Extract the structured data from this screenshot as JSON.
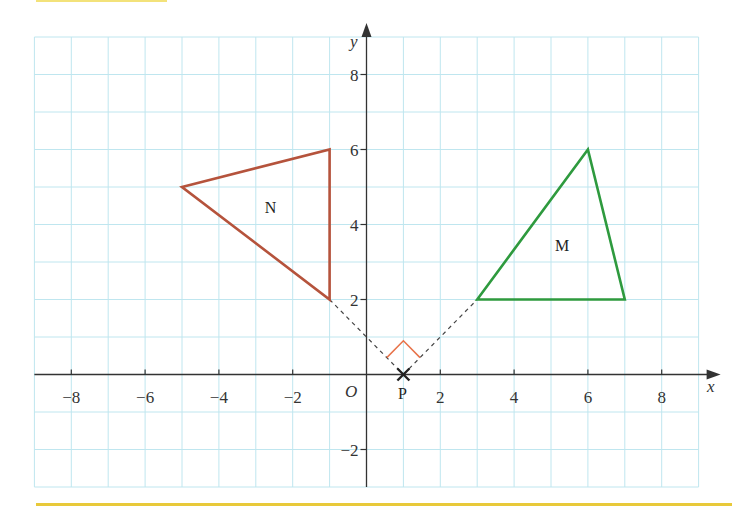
{
  "chart_data": {
    "type": "diagram",
    "title": "",
    "xlabel": "x",
    "ylabel": "y",
    "xlim": [
      -9,
      9
    ],
    "ylim": [
      -3,
      9
    ],
    "grid": true,
    "x_ticks": [
      -8,
      -6,
      -4,
      -2,
      2,
      4,
      6,
      8
    ],
    "y_ticks": [
      -2,
      2,
      4,
      6,
      8
    ],
    "origin_label": "O",
    "shapes": [
      {
        "name": "N",
        "color": "#b5533c",
        "vertices": [
          [
            -5,
            5
          ],
          [
            -1,
            6
          ],
          [
            -1,
            2
          ]
        ],
        "label_pos": [
          -2.6,
          4.3
        ]
      },
      {
        "name": "M",
        "color": "#2e9a3e",
        "vertices": [
          [
            3,
            2
          ],
          [
            6,
            6
          ],
          [
            7,
            2
          ]
        ],
        "label_pos": [
          5.3,
          3.3
        ]
      }
    ],
    "point": {
      "name": "P",
      "coords": [
        1,
        0
      ],
      "marker": "cross"
    },
    "construction_lines": [
      {
        "from": [
          -1,
          2
        ],
        "to": [
          1,
          0
        ],
        "style": "dashed"
      },
      {
        "from": [
          1,
          0
        ],
        "to": [
          3,
          2
        ],
        "style": "dashed"
      }
    ],
    "right_angle_marker": {
      "at": [
        1,
        0
      ],
      "color": "#e8734a"
    }
  },
  "labels": {
    "x_axis": "x",
    "y_axis": "y",
    "origin": "O",
    "point_p": "P",
    "shape_n": "N",
    "shape_m": "M",
    "x_tick_labels": [
      "−8",
      "−6",
      "−4",
      "−2",
      "2",
      "4",
      "6",
      "8"
    ],
    "y_tick_labels": [
      "8",
      "6",
      "4",
      "2",
      "−2"
    ]
  },
  "colors": {
    "grid": "#bfe6ef",
    "axis": "#333333",
    "shape_n": "#b5533c",
    "shape_m": "#2e9a3e",
    "right_angle": "#e8734a",
    "accent_bar": "#e8c93a"
  }
}
